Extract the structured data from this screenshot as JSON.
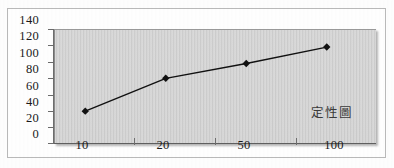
{
  "chart_data": {
    "type": "line",
    "title": "",
    "subtitle": "",
    "xlabel": "",
    "ylabel": "",
    "categories": [
      "10",
      "20",
      "50",
      "100"
    ],
    "series": [
      {
        "name": "定性圖",
        "values": [
          40,
          80,
          98,
          118
        ],
        "marker": "diamond",
        "color": "#111111"
      }
    ],
    "yticks": [
      "0",
      "20",
      "40",
      "60",
      "80",
      "100",
      "120",
      "140"
    ],
    "ytick_values": [
      0,
      20,
      40,
      60,
      80,
      100,
      120,
      140
    ],
    "ylim": [
      0,
      140
    ],
    "grid": false,
    "legend_position": "inside-bottom-right",
    "annotations": [
      {
        "text": "定性圖",
        "position": "inside-bottom-right"
      }
    ],
    "colors": {
      "plot_background": "#cdcdcd",
      "figure_background": "#fefefe",
      "axis": "#6b6b6b",
      "series": "#111111",
      "text": "#1a1a1a",
      "frame_border": "#b9b9b9"
    }
  },
  "annotation_label": "定性圖"
}
